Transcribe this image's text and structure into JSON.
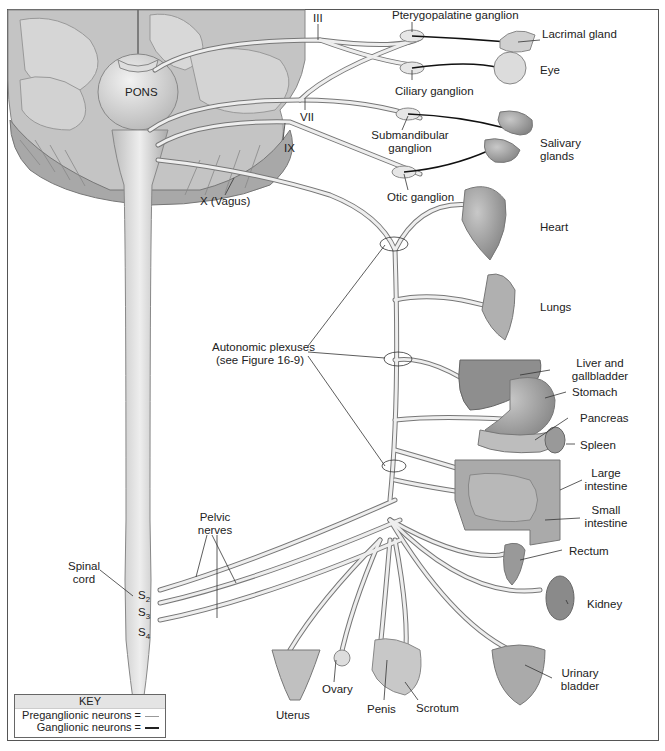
{
  "figure": {
    "colors": {
      "nerve_fill": "#e8e8e8",
      "nerve_stroke": "#777777",
      "ganglionic": "#111111",
      "brain": "#bdbdbd",
      "organ": "#9a9a9a",
      "border": "#555555"
    }
  },
  "labels": {
    "pons": "PONS",
    "cn3": "III",
    "cn7": "VII",
    "cn9": "IX",
    "cn10": "X (Vagus)",
    "pterygopalatine": "Pterygopalatine ganglion",
    "lacrimal": "Lacrimal gland",
    "eye": "Eye",
    "ciliary": "Ciliary ganglion",
    "submandibular_1": "Submandibular",
    "submandibular_2": "ganglion",
    "salivary_1": "Salivary",
    "salivary_2": "glands",
    "otic": "Otic ganglion",
    "heart": "Heart",
    "lungs": "Lungs",
    "plexus_1": "Autonomic plexuses",
    "plexus_2": "(see Figure 16-9)",
    "liver_1": "Liver and",
    "liver_2": "gallbladder",
    "stomach": "Stomach",
    "pancreas": "Pancreas",
    "spleen": "Spleen",
    "large_int_1": "Large",
    "large_int_2": "intestine",
    "small_int_1": "Small",
    "small_int_2": "intestine",
    "rectum": "Rectum",
    "kidney": "Kidney",
    "bladder_1": "Urinary",
    "bladder_2": "bladder",
    "pelvic_1": "Pelvic",
    "pelvic_2": "nerves",
    "spinal_1": "Spinal",
    "spinal_2": "cord",
    "s2": "S",
    "s2_sub": "2",
    "s3": "S",
    "s3_sub": "3",
    "s4": "S",
    "s4_sub": "4",
    "uterus": "Uterus",
    "ovary": "Ovary",
    "penis": "Penis",
    "scrotum": "Scrotum"
  },
  "key": {
    "title": "KEY",
    "items": [
      {
        "label": "Preganglionic neurons =",
        "style": "thin-light-line"
      },
      {
        "label": "Ganglionic neurons =",
        "style": "thick-dark-line"
      }
    ]
  }
}
